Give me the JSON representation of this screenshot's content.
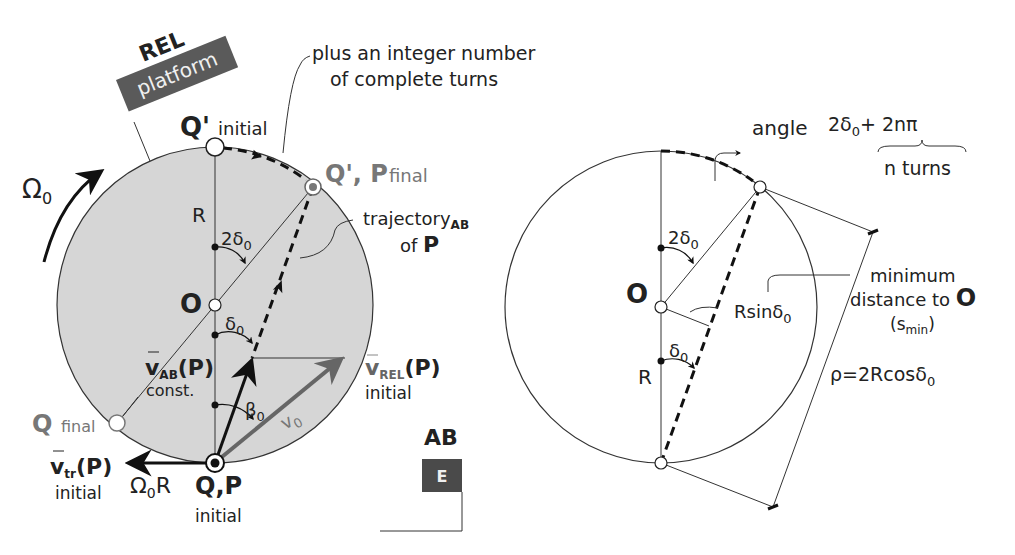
{
  "left_diagram": {
    "flag_title": "REL",
    "flag_label": "platform",
    "callout_top_line1": "plus an integer number",
    "callout_top_line2": "of complete turns",
    "q_prime_initial": "Q'",
    "q_prime_initial_sub": "initial",
    "q_prime_p_final": "Q', P",
    "q_prime_p_final_sub": "final",
    "omega": "Ω",
    "omega_sub": "0",
    "radius_label": "R",
    "angle_2delta": "2δ",
    "angle_2delta_sub": "0",
    "center_label": "O",
    "angle_delta": "δ",
    "angle_delta_sub": "0",
    "trajectory_label": "trajectory",
    "trajectory_sub": "AB",
    "trajectory_of": "of",
    "trajectory_p": "P",
    "v_ab": "v",
    "v_ab_sub": "AB",
    "v_ab_p": "(P)",
    "v_ab_const": "const.",
    "v_rel": "v",
    "v_rel_sub": "REL",
    "v_rel_p": "(P)",
    "v_rel_initial": "initial",
    "beta": "β",
    "beta_sub": "0",
    "v0": "v",
    "v0_sub": "0",
    "q_final": "Q",
    "q_final_sub": "final",
    "v_tr": "v",
    "v_tr_sub": "tr",
    "v_tr_p": "(P)",
    "v_tr_initial": "initial",
    "omega_r": "Ω",
    "omega_r_sub": "0",
    "omega_r_tail": "R",
    "qp_initial": "Q,P",
    "qp_initial_sub": "initial",
    "ab_title": "AB",
    "ab_flag_label": "E"
  },
  "right_diagram": {
    "angle_label": "angle",
    "angle_expr_a": "2δ",
    "angle_expr_a_sub": "0",
    "angle_expr_b": "+ 2nπ",
    "n_turns": "n turns",
    "angle_2delta": "2δ",
    "angle_2delta_sub": "0",
    "center_label": "O",
    "rsin": "Rsinδ",
    "rsin_sub": "0",
    "min_line1": "minimum",
    "min_line2": "distance to",
    "min_o": "O",
    "min_line3": "(s",
    "min_line3_sub": "min",
    "min_line3_close": ")",
    "angle_delta": "δ",
    "angle_delta_sub": "0",
    "radius_label": "R",
    "rho": "ρ=2Rcosδ",
    "rho_sub": "0"
  },
  "colors": {
    "platform_fill": "#d6d6d6",
    "flag_fill": "#5a5a5a",
    "stroke": "#222222",
    "gray_text": "#777777"
  }
}
